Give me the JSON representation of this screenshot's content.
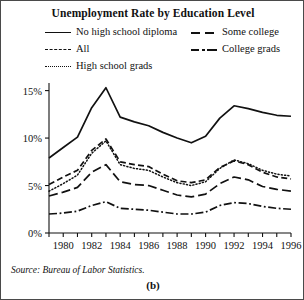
{
  "figure": {
    "panel_label": "(b)",
    "source_note": "Source: Bureau of Labor Statistics.",
    "border_color": "#4a4a4a",
    "ink_color": "#111111",
    "background": "#ffffff"
  },
  "legend": {
    "position": "top",
    "entries": [
      {
        "label": "No high school diploma",
        "style": "solid"
      },
      {
        "label": "All",
        "style": "dashed"
      },
      {
        "label": "High school grads",
        "style": "dotted"
      },
      {
        "label": "Some college",
        "style": "long-dash"
      },
      {
        "label": "College grads",
        "style": "dash-dot"
      }
    ]
  },
  "chart_data": {
    "type": "line",
    "title": "Unemployment Rate by Education Level",
    "xlabel": "",
    "ylabel": "",
    "grid": false,
    "legend_position": "top",
    "x": [
      1979,
      1980,
      1981,
      1982,
      1983,
      1984,
      1985,
      1986,
      1987,
      1988,
      1989,
      1990,
      1991,
      1992,
      1993,
      1994,
      1995,
      1996
    ],
    "xlim": [
      1979,
      1996
    ],
    "xticks": [
      1979,
      1980,
      1981,
      1982,
      1983,
      1984,
      1985,
      1986,
      1987,
      1988,
      1989,
      1990,
      1991,
      1992,
      1993,
      1994,
      1995,
      1996
    ],
    "xtick_labels": [
      "",
      "1980",
      "",
      "1982",
      "",
      "1984",
      "",
      "1986",
      "",
      "1988",
      "",
      "1990",
      "",
      "1992",
      "",
      "1994",
      "",
      "1996"
    ],
    "ylim": [
      0,
      15.8
    ],
    "yticks": [
      0,
      5,
      10,
      15
    ],
    "ytick_labels": [
      "0%",
      "5%",
      "10%",
      "15%"
    ],
    "series": [
      {
        "name": "No high school diploma",
        "style": "solid",
        "values": [
          7.9,
          9.0,
          10.1,
          13.2,
          15.3,
          12.2,
          11.7,
          11.3,
          10.6,
          10.0,
          9.5,
          10.2,
          12.1,
          13.4,
          13.1,
          12.7,
          12.4,
          12.3
        ]
      },
      {
        "name": "All",
        "style": "dashed",
        "values": [
          5.1,
          5.9,
          6.6,
          8.7,
          9.9,
          7.5,
          7.2,
          7.0,
          6.2,
          5.5,
          5.3,
          5.6,
          6.9,
          7.6,
          7.2,
          6.4,
          5.9,
          5.7
        ]
      },
      {
        "name": "High school grads",
        "style": "dotted",
        "values": [
          4.4,
          5.2,
          6.1,
          8.4,
          9.7,
          7.2,
          6.8,
          6.6,
          5.9,
          5.3,
          5.0,
          5.4,
          6.8,
          7.7,
          7.3,
          6.6,
          6.2,
          6.0
        ]
      },
      {
        "name": "Some college",
        "style": "long-dash",
        "values": [
          3.9,
          4.3,
          4.8,
          6.4,
          7.2,
          5.4,
          5.1,
          5.0,
          4.5,
          4.0,
          3.8,
          4.1,
          5.2,
          5.9,
          5.6,
          4.9,
          4.6,
          4.4
        ]
      },
      {
        "name": "College grads",
        "style": "dash-dot",
        "values": [
          2.0,
          2.1,
          2.3,
          2.9,
          3.3,
          2.6,
          2.5,
          2.4,
          2.2,
          2.0,
          2.0,
          2.2,
          2.9,
          3.2,
          3.1,
          2.8,
          2.6,
          2.5
        ]
      }
    ]
  }
}
